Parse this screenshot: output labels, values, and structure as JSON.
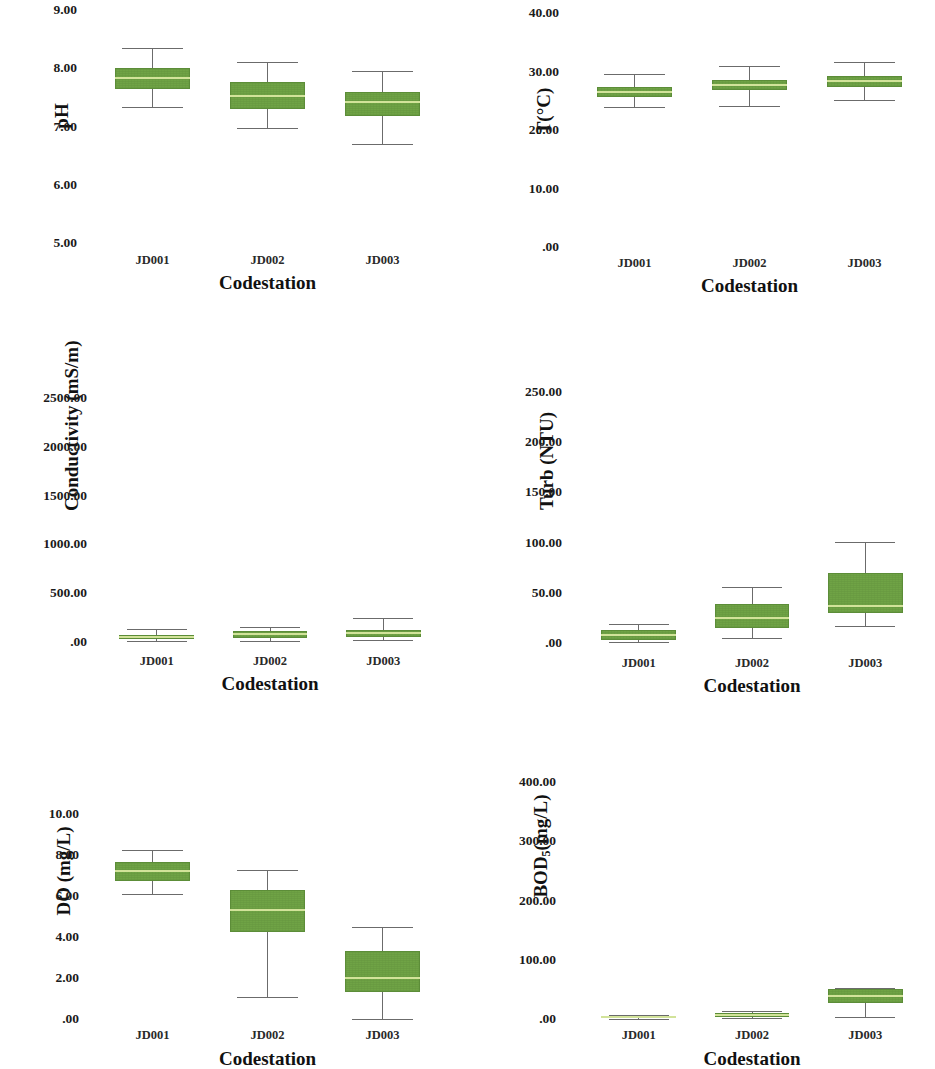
{
  "figure": {
    "background_color": "#ffffff",
    "box_fill_color": "#6fa345",
    "box_edge_color": "#5c8d38",
    "median_color": "#d2e39a",
    "whisker_color": "#6b6b6b",
    "panel_count": 6,
    "grid": "3 rows x 2 columns"
  },
  "chart_data": [
    {
      "type": "box",
      "panel": "ph",
      "title": "",
      "xlabel": "Codestation",
      "ylabel": "pH",
      "ylim": [
        5.0,
        9.0
      ],
      "ytick_labels": [
        "9.00",
        "8.00",
        "7.00",
        "6.00",
        "5.00"
      ],
      "ytick_values": [
        9.0,
        8.0,
        7.0,
        6.0,
        5.0
      ],
      "categories": [
        "JD001",
        "JD002",
        "JD003"
      ],
      "grid": false,
      "legend": "none",
      "boxes": [
        {
          "category": "JD001",
          "whisker_low": 7.33,
          "q1": 7.65,
          "median": 7.83,
          "q3": 8.0,
          "whisker_high": 8.35
        },
        {
          "category": "JD002",
          "whisker_low": 6.98,
          "q1": 7.3,
          "median": 7.52,
          "q3": 7.76,
          "whisker_high": 8.1
        },
        {
          "category": "JD003",
          "whisker_low": 6.7,
          "q1": 7.18,
          "median": 7.42,
          "q3": 7.6,
          "whisker_high": 7.95
        }
      ]
    },
    {
      "type": "box",
      "panel": "temperature",
      "title": "",
      "xlabel": "Codestation",
      "ylabel": "T(°C)",
      "ylim": [
        0.0,
        40.0
      ],
      "ytick_labels": [
        "40.00",
        "30.00",
        "20.00",
        "10.00",
        ".00"
      ],
      "ytick_values": [
        40.0,
        30.0,
        20.0,
        10.0,
        0.0
      ],
      "categories": [
        "JD001",
        "JD002",
        "JD003"
      ],
      "grid": false,
      "legend": "none",
      "boxes": [
        {
          "category": "JD001",
          "whisker_low": 24.0,
          "q1": 25.7,
          "median": 26.5,
          "q3": 27.3,
          "whisker_high": 29.5
        },
        {
          "category": "JD002",
          "whisker_low": 24.1,
          "q1": 26.9,
          "median": 27.7,
          "q3": 28.6,
          "whisker_high": 31.0
        },
        {
          "category": "JD003",
          "whisker_low": 25.1,
          "q1": 27.4,
          "median": 28.3,
          "q3": 29.3,
          "whisker_high": 31.7
        }
      ]
    },
    {
      "type": "box",
      "panel": "conductivity",
      "title": "",
      "xlabel": "Codestation",
      "ylabel": "Conductivity (mS/m)",
      "ylim": [
        0.0,
        2500.0
      ],
      "ytick_labels": [
        "2500.00",
        "2000.00",
        "1500.00",
        "1000.00",
        "500.00",
        ".00"
      ],
      "ytick_values": [
        2500.0,
        2000.0,
        1500.0,
        1000.0,
        500.0,
        0.0
      ],
      "categories": [
        "JD001",
        "JD002",
        "JD003"
      ],
      "grid": false,
      "legend": "none",
      "boxes": [
        {
          "category": "JD001",
          "whisker_low": 10,
          "q1": 30,
          "median": 55,
          "q3": 75,
          "whisker_high": 135
        },
        {
          "category": "JD002",
          "whisker_low": 15,
          "q1": 45,
          "median": 80,
          "q3": 110,
          "whisker_high": 150
        },
        {
          "category": "JD003",
          "whisker_low": 20,
          "q1": 50,
          "median": 90,
          "q3": 125,
          "whisker_high": 250
        }
      ]
    },
    {
      "type": "box",
      "panel": "turbidity",
      "title": "",
      "xlabel": "Codestation",
      "ylabel": "Turb (NTU)",
      "ylim": [
        0.0,
        250.0
      ],
      "ytick_labels": [
        "250.00",
        "200.00",
        "150.00",
        "100.00",
        "50.00",
        ".00"
      ],
      "ytick_values": [
        250.0,
        200.0,
        150.0,
        100.0,
        50.0,
        0.0
      ],
      "categories": [
        "JD001",
        "JD002",
        "JD003"
      ],
      "grid": false,
      "legend": "none",
      "boxes": [
        {
          "category": "JD001",
          "whisker_low": 1.0,
          "q1": 3.0,
          "median": 8.0,
          "q3": 13.0,
          "whisker_high": 19.0
        },
        {
          "category": "JD002",
          "whisker_low": 5.0,
          "q1": 15.0,
          "median": 25.0,
          "q3": 39.0,
          "whisker_high": 56.0
        },
        {
          "category": "JD003",
          "whisker_low": 17.0,
          "q1": 30.0,
          "median": 37.0,
          "q3": 70.0,
          "whisker_high": 101.0
        }
      ]
    },
    {
      "type": "box",
      "panel": "dissolved_oxygen",
      "title": "",
      "xlabel": "Codestation",
      "ylabel": "DO (mg/L)",
      "ylim": [
        0.0,
        10.0
      ],
      "ytick_labels": [
        "10.00",
        "8.00",
        "6.00",
        "4.00",
        "2.00",
        ".00"
      ],
      "ytick_values": [
        10.0,
        8.0,
        6.0,
        4.0,
        2.0,
        0.0
      ],
      "categories": [
        "JD001",
        "JD002",
        "JD003"
      ],
      "grid": false,
      "legend": "none",
      "boxes": [
        {
          "category": "JD001",
          "whisker_low": 6.1,
          "q1": 6.75,
          "median": 7.2,
          "q3": 7.65,
          "whisker_high": 8.25
        },
        {
          "category": "JD002",
          "whisker_low": 1.05,
          "q1": 4.25,
          "median": 5.3,
          "q3": 6.3,
          "whisker_high": 7.25
        },
        {
          "category": "JD003",
          "whisker_low": 0.0,
          "q1": 1.3,
          "median": 2.0,
          "q3": 3.3,
          "whisker_high": 4.5
        }
      ]
    },
    {
      "type": "box",
      "panel": "bod5",
      "title": "",
      "xlabel": "Codestation",
      "ylabel": "BOD5(mg/L)",
      "ylabel_base": "BOD",
      "ylabel_sub": "5",
      "ylabel_tail": "(mg/L)",
      "ylim": [
        0.0,
        400.0
      ],
      "ytick_labels": [
        "400.00",
        "300.00",
        "200.00",
        "100.00",
        ".00"
      ],
      "ytick_values": [
        400.0,
        300.0,
        200.0,
        100.0,
        0.0
      ],
      "categories": [
        "JD001",
        "JD002",
        "JD003"
      ],
      "grid": false,
      "legend": "none",
      "boxes": [
        {
          "category": "JD001",
          "whisker_low": 0.5,
          "q1": 1.5,
          "median": 3.0,
          "q3": 5.0,
          "whisker_high": 7.0
        },
        {
          "category": "JD002",
          "whisker_low": 1.0,
          "q1": 3.0,
          "median": 6.0,
          "q3": 10.0,
          "whisker_high": 14.0
        },
        {
          "category": "JD003",
          "whisker_low": 3.0,
          "q1": 27.0,
          "median": 38.0,
          "q3": 50.0,
          "whisker_high": 53.0
        }
      ]
    }
  ]
}
